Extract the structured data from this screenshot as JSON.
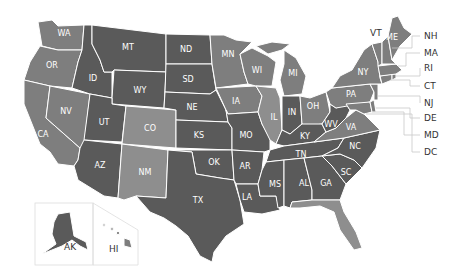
{
  "colors": {
    "dark": "#5a5a5a",
    "medium": "#7e7e7e",
    "light": "#8e8e8e",
    "border": "#ffffff",
    "external_label": "#333333"
  },
  "states": {
    "WA": {
      "label": "WA",
      "shade": "medium"
    },
    "OR": {
      "label": "OR",
      "shade": "medium"
    },
    "CA": {
      "label": "CA",
      "shade": "medium"
    },
    "NV": {
      "label": "NV",
      "shade": "medium"
    },
    "ID": {
      "label": "ID",
      "shade": "dark"
    },
    "MT": {
      "label": "MT",
      "shade": "dark"
    },
    "WY": {
      "label": "WY",
      "shade": "dark"
    },
    "UT": {
      "label": "UT",
      "shade": "dark"
    },
    "CO": {
      "label": "CO",
      "shade": "light"
    },
    "AZ": {
      "label": "AZ",
      "shade": "dark"
    },
    "NM": {
      "label": "NM",
      "shade": "light"
    },
    "ND": {
      "label": "ND",
      "shade": "dark"
    },
    "SD": {
      "label": "SD",
      "shade": "dark"
    },
    "NE": {
      "label": "NE",
      "shade": "dark"
    },
    "KS": {
      "label": "KS",
      "shade": "dark"
    },
    "OK": {
      "label": "OK",
      "shade": "dark"
    },
    "TX": {
      "label": "TX",
      "shade": "dark"
    },
    "MN": {
      "label": "MN",
      "shade": "medium"
    },
    "IA": {
      "label": "IA",
      "shade": "medium"
    },
    "MO": {
      "label": "MO",
      "shade": "dark"
    },
    "AR": {
      "label": "AR",
      "shade": "dark"
    },
    "LA": {
      "label": "LA",
      "shade": "dark"
    },
    "WI": {
      "label": "WI",
      "shade": "medium"
    },
    "IL": {
      "label": "IL",
      "shade": "light"
    },
    "MI": {
      "label": "MI",
      "shade": "medium"
    },
    "IN": {
      "label": "IN",
      "shade": "dark"
    },
    "OH": {
      "label": "OH",
      "shade": "medium"
    },
    "KY": {
      "label": "KY",
      "shade": "dark"
    },
    "TN": {
      "label": "TN",
      "shade": "dark"
    },
    "MS": {
      "label": "MS",
      "shade": "dark"
    },
    "AL": {
      "label": "AL",
      "shade": "dark"
    },
    "GA": {
      "label": "GA",
      "shade": "dark"
    },
    "FL": {
      "label": "FL",
      "shade": "light"
    },
    "SC": {
      "label": "SC",
      "shade": "dark"
    },
    "NC": {
      "label": "NC",
      "shade": "dark"
    },
    "VA": {
      "label": "VA",
      "shade": "medium"
    },
    "WV": {
      "label": "WV",
      "shade": "dark"
    },
    "PA": {
      "label": "PA",
      "shade": "medium"
    },
    "NY": {
      "label": "NY",
      "shade": "medium"
    },
    "VT": {
      "label": "VT",
      "shade": "medium"
    },
    "ME": {
      "label": "ME",
      "shade": "medium"
    },
    "NH": {
      "label": "NH",
      "shade": "medium"
    },
    "MA": {
      "label": "MA",
      "shade": "medium"
    },
    "RI": {
      "label": "RI",
      "shade": "medium"
    },
    "CT": {
      "label": "CT",
      "shade": "medium"
    },
    "NJ": {
      "label": "NJ",
      "shade": "medium"
    },
    "DE": {
      "label": "DE",
      "shade": "medium"
    },
    "MD": {
      "label": "MD",
      "shade": "medium"
    },
    "DC": {
      "label": "DC",
      "shade": "medium"
    },
    "AK": {
      "label": "AK",
      "shade": "dark"
    },
    "HI": {
      "label": "HI",
      "shade": "medium"
    }
  },
  "external_labels": [
    "NH",
    "MA",
    "RI",
    "CT",
    "NJ",
    "DE",
    "MD",
    "DC"
  ],
  "outside_label_VT": "VT"
}
